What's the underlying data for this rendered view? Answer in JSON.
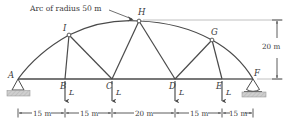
{
  "figure": {
    "title_note": "Arc of radius 50 m",
    "structure_type": "arched truss",
    "line_color": "#4a4a4a",
    "ground_color": "#c9c9c9",
    "text_color": "#3a3a3a"
  },
  "annotation": {
    "arc_note": "Arc of radius 50 m",
    "arc_note_target": "H"
  },
  "nodes": [
    {
      "id": "A",
      "label": "A",
      "kind": "support-pin",
      "x": 18,
      "y": 79,
      "lx": 8,
      "ly": 71
    },
    {
      "id": "B",
      "label": "B",
      "kind": "joint",
      "x": 65,
      "y": 79,
      "lx": 60,
      "ly": 84
    },
    {
      "id": "C",
      "label": "C",
      "kind": "joint",
      "x": 112,
      "y": 79,
      "lx": 106,
      "ly": 84
    },
    {
      "id": "D",
      "label": "D",
      "kind": "joint",
      "x": 175,
      "y": 79,
      "lx": 169,
      "ly": 84
    },
    {
      "id": "E",
      "label": "E",
      "kind": "joint",
      "x": 222,
      "y": 79,
      "lx": 216,
      "ly": 84
    },
    {
      "id": "F",
      "label": "F",
      "kind": "support-roller",
      "x": 253,
      "y": 79,
      "lx": 254,
      "ly": 71
    },
    {
      "id": "G",
      "label": "G",
      "kind": "joint",
      "x": 212,
      "y": 40,
      "lx": 211,
      "ly": 30
    },
    {
      "id": "H",
      "label": "H",
      "kind": "joint-apex",
      "x": 139,
      "y": 21,
      "lx": 138,
      "ly": 11
    },
    {
      "id": "I",
      "label": "I",
      "kind": "joint",
      "x": 69,
      "y": 35,
      "lx": 63,
      "ly": 27
    }
  ],
  "members": {
    "bottom_chord": [
      "A-B",
      "B-C",
      "C-D",
      "D-E",
      "E-F"
    ],
    "top_chord_arc": [
      "A-I",
      "I-H",
      "H-G",
      "G-F"
    ],
    "verticals": [
      "I-B",
      "G-E"
    ],
    "diagonals": [
      "I-C",
      "H-C",
      "H-D",
      "G-D"
    ]
  },
  "loads": [
    {
      "at": "B",
      "label": "L",
      "direction": "down",
      "x": 65,
      "ay_top": 81,
      "ay_bot": 103,
      "lx": 69,
      "ly": 92
    },
    {
      "at": "C",
      "label": "L",
      "direction": "down",
      "x": 112,
      "ay_top": 81,
      "ay_bot": 103,
      "lx": 116,
      "ly": 92
    },
    {
      "at": "D",
      "label": "L",
      "direction": "down",
      "x": 175,
      "ay_top": 81,
      "ay_bot": 103,
      "lx": 179,
      "ly": 92
    },
    {
      "at": "E",
      "label": "L",
      "direction": "down",
      "x": 222,
      "ay_top": 81,
      "ay_bot": 103,
      "lx": 226,
      "ly": 92
    }
  ],
  "dimensions": {
    "horizontal": {
      "y": 113,
      "ticks": [
        18,
        65,
        112,
        175,
        222,
        253
      ],
      "segments": [
        {
          "label": "15 m",
          "from": "A",
          "to": "B",
          "cx": 41.5
        },
        {
          "label": "15 m",
          "from": "B",
          "to": "C",
          "cx": 88.5
        },
        {
          "label": "20 m",
          "from": "C",
          "to": "D",
          "cx": 143.5
        },
        {
          "label": "15 m",
          "from": "D",
          "to": "E",
          "cx": 198.5
        },
        {
          "label": "15 m",
          "from": "E",
          "to": "F",
          "cx": 237.5
        }
      ]
    },
    "vertical": {
      "label": "20 m",
      "x": 277,
      "y_top": 21,
      "y_bottom": 79,
      "lx": 263,
      "ly": 46
    }
  },
  "supports": {
    "pin": {
      "at": "A",
      "description": "pin support with hatched ground"
    },
    "roller": {
      "at": "F",
      "description": "rocker/roller support with base plate"
    }
  }
}
